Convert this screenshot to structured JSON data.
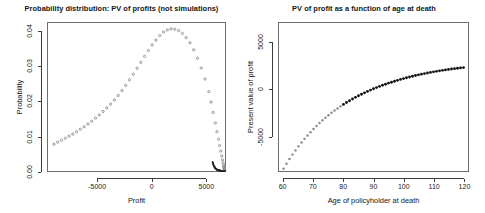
{
  "figure": {
    "width": 485,
    "height": 213,
    "background": "#ffffff",
    "point_color_open": "#8c8c8c",
    "point_color_solid": "#111111",
    "axis_color": "#3d3d3d"
  },
  "chart_data": [
    {
      "type": "scatter",
      "panel": "left",
      "title": "Probability distribution: PV of profits (not simulations)",
      "xlabel": "Profit",
      "ylabel": "Probability",
      "xlim": [
        -9600,
        6800
      ],
      "ylim": [
        0,
        0.0425
      ],
      "xticks": [
        -5000,
        0,
        5000
      ],
      "xticklabels": [
        "-5000",
        "0",
        "5000"
      ],
      "yticks": [
        0.0,
        0.01,
        0.02,
        0.03,
        0.04
      ],
      "yticklabels": [
        "0.00",
        "0.01",
        "0.02",
        "0.03",
        "0.04"
      ],
      "grid": false,
      "legend": "none",
      "marker": "open-circle",
      "x": [
        -9050,
        -8700,
        -8350,
        -8000,
        -7650,
        -7300,
        -6950,
        -6600,
        -6250,
        -5900,
        -5550,
        -5200,
        -4850,
        -4500,
        -4150,
        -3800,
        -3450,
        -3100,
        -2750,
        -2400,
        -2050,
        -1700,
        -1350,
        -1000,
        -650,
        -300,
        50,
        400,
        750,
        1100,
        1450,
        1800,
        2150,
        2500,
        2850,
        3200,
        3550,
        3900,
        4250,
        4600,
        4950,
        5300,
        5500,
        5700,
        5900,
        6050,
        6200,
        6300,
        6400,
        6500,
        6570,
        6620,
        6660,
        6690,
        6710,
        6730,
        6745,
        6755,
        6765,
        6772
      ],
      "y": [
        0.0077,
        0.0083,
        0.0088,
        0.0094,
        0.01,
        0.0106,
        0.0113,
        0.012,
        0.0127,
        0.0135,
        0.0143,
        0.0152,
        0.0161,
        0.0171,
        0.0181,
        0.0192,
        0.0204,
        0.0217,
        0.0231,
        0.0246,
        0.0262,
        0.0278,
        0.0295,
        0.0312,
        0.0329,
        0.0346,
        0.0362,
        0.0376,
        0.0389,
        0.0399,
        0.0405,
        0.0408,
        0.0407,
        0.0403,
        0.0395,
        0.0383,
        0.0368,
        0.0348,
        0.0324,
        0.0296,
        0.0264,
        0.0228,
        0.0198,
        0.0168,
        0.0138,
        0.0113,
        0.0091,
        0.0073,
        0.0057,
        0.0043,
        0.0032,
        0.0024,
        0.0018,
        0.0013,
        0.001,
        0.0008,
        0.0006,
        0.0005,
        0.0004,
        0.0003
      ],
      "tail_note": "dense dark tail of points along y≈0 from x≈5600 to x≈6800"
    },
    {
      "type": "scatter",
      "panel": "right",
      "title": "PV of profit as a function of age at death",
      "xlabel": "Age of policyholder at death",
      "ylabel": "Present value of profit",
      "xlim": [
        58.5,
        121.5
      ],
      "ylim": [
        -8700,
        7100
      ],
      "xticks": [
        60,
        70,
        80,
        90,
        100,
        110,
        120
      ],
      "xticklabels": [
        "60",
        "70",
        "80",
        "90",
        "100",
        "110",
        "120"
      ],
      "yticks": [
        -5000,
        0,
        5000
      ],
      "yticklabels": [
        "-5000",
        "0",
        "5000"
      ],
      "grid": false,
      "legend": "none",
      "marker": "filled-circle",
      "x": [
        60,
        61,
        62,
        63,
        64,
        65,
        66,
        67,
        68,
        69,
        70,
        71,
        72,
        73,
        74,
        75,
        76,
        77,
        78,
        79,
        80,
        81,
        82,
        83,
        84,
        85,
        86,
        87,
        88,
        89,
        90,
        91,
        92,
        93,
        94,
        95,
        96,
        97,
        98,
        99,
        100,
        101,
        102,
        103,
        104,
        105,
        106,
        107,
        108,
        109,
        110,
        111,
        112,
        113,
        114,
        115,
        116,
        117,
        118,
        119,
        120
      ],
      "y": [
        -8450,
        -7930,
        -7430,
        -6950,
        -6500,
        -6070,
        -5660,
        -5270,
        -4900,
        -4550,
        -4210,
        -3890,
        -3580,
        -3290,
        -3010,
        -2745,
        -2490,
        -2250,
        -2020,
        -1800,
        -1590,
        -1390,
        -1200,
        -1015,
        -840,
        -670,
        -510,
        -355,
        -205,
        -60,
        75,
        205,
        330,
        450,
        565,
        675,
        780,
        880,
        980,
        1075,
        1165,
        1250,
        1335,
        1415,
        1490,
        1565,
        1635,
        1700,
        1765,
        1825,
        1885,
        1940,
        1995,
        2045,
        2095,
        2140,
        2185,
        2228,
        2268,
        2306,
        2342
      ]
    }
  ]
}
